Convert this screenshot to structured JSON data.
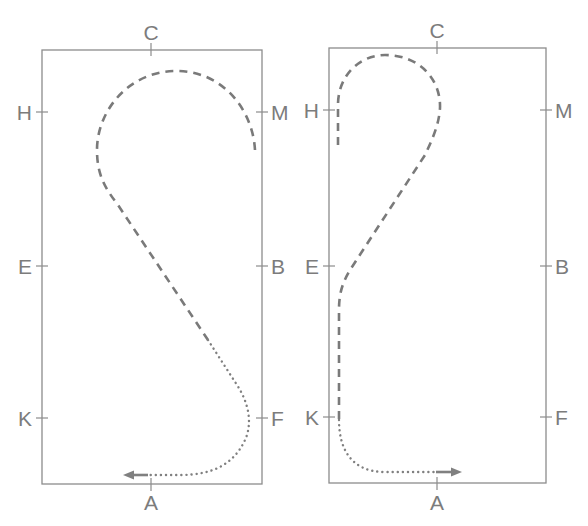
{
  "diagrams": [
    {
      "id": "left",
      "markers": {
        "top": "C",
        "bottom": "A",
        "left": [
          "H",
          "E",
          "K"
        ],
        "right": [
          "M",
          "B",
          "F"
        ]
      },
      "path_description": "Starts near M, loops over toward C and H, diagonal dashed line across to F, dotted curve around F ending with arrow toward A pointing left",
      "arrow_direction": "left"
    },
    {
      "id": "right",
      "markers": {
        "top": "C",
        "bottom": "A",
        "left": [
          "H",
          "E",
          "K"
        ],
        "right": [
          "M",
          "B",
          "F"
        ]
      },
      "path_description": "Starts below H, loops up toward C, diagonal dashed line down to E, straight down near K, dotted curve ending with arrow toward A pointing right",
      "arrow_direction": "right"
    }
  ],
  "labels": {
    "left": {
      "C": "C",
      "A": "A",
      "H": "H",
      "E": "E",
      "K": "K",
      "M": "M",
      "B": "B",
      "F": "F"
    },
    "right": {
      "C": "C",
      "A": "A",
      "H": "H",
      "E": "E",
      "K": "K",
      "M": "M",
      "B": "B",
      "F": "F"
    }
  },
  "colors": {
    "frame": "#8c8c8c",
    "label": "#7c7c7c",
    "path": "#7a7a7a"
  }
}
